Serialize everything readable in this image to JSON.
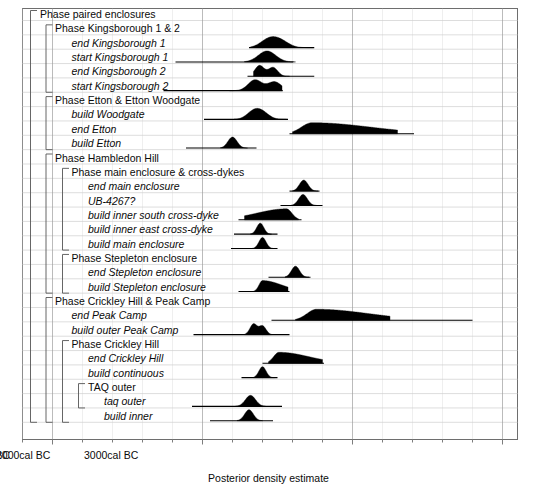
{
  "chart_data": {
    "type": "area",
    "title": "",
    "xlabel": "Posterior density estimate",
    "ylabel": "",
    "xlim": [
      5200,
      1900
    ],
    "x_direction": "cal BC decreasing left to right",
    "grid": true,
    "legend": null,
    "axis": {
      "ticks": [
        {
          "value": 5000,
          "label": "5000cal BC"
        },
        {
          "value": 4000,
          "label": "4000cal BC"
        },
        {
          "value": 3000,
          "label": "3000cal BC"
        },
        {
          "value": 2000,
          "label": "2000cal BC"
        }
      ],
      "minor_tick_interval": 200
    },
    "rows": [
      {
        "label": "Phase paired enclosures",
        "kind": "group",
        "depth": 0,
        "distribution": null,
        "range": null
      },
      {
        "label": "Phase Kingsborough 1 & 2",
        "kind": "group",
        "depth": 1,
        "distribution": null,
        "range": null
      },
      {
        "label": "end Kingsborough 1",
        "kind": "event",
        "depth": 2,
        "distribution": {
          "mode": 3520,
          "peaks": [
            3560,
            3480
          ],
          "start": 3680,
          "end": 3260,
          "shape": "bimodal"
        },
        "range": {
          "from": 3690,
          "to": 3255
        }
      },
      {
        "label": "start Kingsborough 1",
        "kind": "event",
        "depth": 2,
        "distribution": {
          "mode": 3570,
          "peaks": [
            3570
          ],
          "start": 3720,
          "end": 3380,
          "shape": "unimodal"
        },
        "range": {
          "from": 4180,
          "to": 3395
        }
      },
      {
        "label": "end Kingsborough 2",
        "kind": "event",
        "depth": 2,
        "distribution": {
          "mode": 3540,
          "peaks": [
            3620,
            3530
          ],
          "start": 3660,
          "end": 3420,
          "shape": "bimodal"
        },
        "range": {
          "from": 3700,
          "to": 3255
        }
      },
      {
        "label": "start Kingsborough 2",
        "kind": "event",
        "depth": 2,
        "distribution": {
          "mode": 3640,
          "peaks": [
            3650,
            3520
          ],
          "start": 3820,
          "end": 3470,
          "shape": "bimodal"
        },
        "range": {
          "from": 4260,
          "to": 3465
        }
      },
      {
        "label": "Phase Etton & Etton Woodgate",
        "kind": "group",
        "depth": 1,
        "distribution": null,
        "range": null
      },
      {
        "label": "build Woodgate",
        "kind": "event",
        "depth": 2,
        "distribution": {
          "mode": 3620,
          "peaks": [
            3660,
            3600
          ],
          "start": 3790,
          "end": 3440,
          "shape": "bimodal"
        },
        "range": {
          "from": 3990,
          "to": 3430
        }
      },
      {
        "label": "end Etton",
        "kind": "event",
        "depth": 2,
        "distribution": {
          "mode": 3270,
          "peaks": [
            3270
          ],
          "start": 3400,
          "end": 2700,
          "shape": "right-skewed"
        },
        "range": {
          "from": 3420,
          "to": 2590
        }
      },
      {
        "label": "build Etton",
        "kind": "event",
        "depth": 2,
        "distribution": {
          "mode": 3800,
          "peaks": [
            3800
          ],
          "start": 3880,
          "end": 3700,
          "shape": "unimodal"
        },
        "range": {
          "from": 4110,
          "to": 3640
        }
      },
      {
        "label": "Phase Hambledon Hill",
        "kind": "group",
        "depth": 1,
        "distribution": null,
        "range": null
      },
      {
        "label": "Phase main enclosure & cross-dykes",
        "kind": "group",
        "depth": 2,
        "distribution": null,
        "range": null
      },
      {
        "label": "end main enclosure",
        "kind": "event",
        "depth": 3,
        "distribution": {
          "mode": 3325,
          "peaks": [
            3325
          ],
          "start": 3400,
          "end": 3230,
          "shape": "unimodal"
        },
        "range": {
          "from": 3420,
          "to": 3220
        }
      },
      {
        "label": "UB-4267?",
        "kind": "event",
        "depth": 3,
        "distribution": {
          "mode": 3330,
          "peaks": [
            3330
          ],
          "start": 3410,
          "end": 3240,
          "shape": "unimodal"
        },
        "range": {
          "from": 3480,
          "to": 3200
        }
      },
      {
        "label": "build inner south cross-dyke",
        "kind": "event",
        "depth": 3,
        "distribution": {
          "mode": 3440,
          "peaks": [
            3440
          ],
          "start": 3720,
          "end": 3360,
          "shape": "left-skewed"
        },
        "range": {
          "from": 3760,
          "to": 3340
        }
      },
      {
        "label": "build inner east cross-dyke",
        "kind": "event",
        "depth": 3,
        "distribution": {
          "mode": 3615,
          "peaks": [
            3615
          ],
          "start": 3680,
          "end": 3540,
          "shape": "unimodal"
        },
        "range": {
          "from": 3790,
          "to": 3500
        }
      },
      {
        "label": "build main enclosure",
        "kind": "event",
        "depth": 3,
        "distribution": {
          "mode": 3600,
          "peaks": [
            3600
          ],
          "start": 3670,
          "end": 3530,
          "shape": "unimodal"
        },
        "range": {
          "from": 3810,
          "to": 3500
        }
      },
      {
        "label": "Phase Stepleton enclosure",
        "kind": "group",
        "depth": 2,
        "distribution": null,
        "range": null
      },
      {
        "label": "end Stepleton enclosure",
        "kind": "event",
        "depth": 3,
        "distribution": {
          "mode": 3380,
          "peaks": [
            3380
          ],
          "start": 3450,
          "end": 3290,
          "shape": "unimodal"
        },
        "range": {
          "from": 3560,
          "to": 3280
        }
      },
      {
        "label": "build Stepleton enclosure",
        "kind": "event",
        "depth": 3,
        "distribution": {
          "mode": 3600,
          "peaks": [
            3600
          ],
          "start": 3660,
          "end": 3430,
          "shape": "right-skewed"
        },
        "range": {
          "from": 3760,
          "to": 3420
        }
      },
      {
        "label": "Phase Crickley Hill & Peak Camp",
        "kind": "group",
        "depth": 1,
        "distribution": null,
        "range": null
      },
      {
        "label": "end Peak Camp",
        "kind": "event",
        "depth": 2,
        "distribution": {
          "mode": 3240,
          "peaks": [
            3240
          ],
          "start": 3380,
          "end": 2750,
          "shape": "right-skewed"
        },
        "range": {
          "from": 3540,
          "to": 2200
        }
      },
      {
        "label": "build outer Peak Camp",
        "kind": "event",
        "depth": 2,
        "distribution": {
          "mode": 3640,
          "peaks": [
            3660,
            3600
          ],
          "start": 3720,
          "end": 3540,
          "shape": "bimodal"
        },
        "range": {
          "from": 4060,
          "to": 3420
        }
      },
      {
        "label": "Phase Crickley Hill",
        "kind": "group",
        "depth": 2,
        "distribution": null,
        "range": null
      },
      {
        "label": "end Crickley Hill",
        "kind": "event",
        "depth": 3,
        "distribution": {
          "mode": 3490,
          "peaks": [
            3490
          ],
          "start": 3560,
          "end": 3200,
          "shape": "right-skewed"
        },
        "range": {
          "from": 3600,
          "to": 3190
        }
      },
      {
        "label": "build continuous",
        "kind": "event",
        "depth": 3,
        "distribution": {
          "mode": 3600,
          "peaks": [
            3600
          ],
          "start": 3660,
          "end": 3520,
          "shape": "unimodal"
        },
        "range": {
          "from": 3740,
          "to": 3500
        }
      },
      {
        "label": "TAQ outer",
        "kind": "group",
        "depth": 3,
        "distribution": null,
        "range": null
      },
      {
        "label": "taq outer",
        "kind": "event",
        "depth": 4,
        "distribution": {
          "mode": 3680,
          "peaks": [
            3680
          ],
          "start": 3780,
          "end": 3580,
          "shape": "unimodal"
        },
        "range": {
          "from": 4070,
          "to": 3470
        }
      },
      {
        "label": "build inner",
        "kind": "event",
        "depth": 4,
        "distribution": {
          "mode": 3690,
          "peaks": [
            3690
          ],
          "start": 3770,
          "end": 3600,
          "shape": "unimodal"
        },
        "range": {
          "from": 3950,
          "to": 3530
        }
      }
    ],
    "brackets": [
      {
        "depth": 0,
        "from_row": 0,
        "to_row": 28
      },
      {
        "depth": 1,
        "from_row": 1,
        "to_row": 5
      },
      {
        "depth": 1,
        "from_row": 6,
        "to_row": 9
      },
      {
        "depth": 1,
        "from_row": 10,
        "to_row": 19
      },
      {
        "depth": 2,
        "from_row": 11,
        "to_row": 16
      },
      {
        "depth": 2,
        "from_row": 17,
        "to_row": 19
      },
      {
        "depth": 1,
        "from_row": 20,
        "to_row": 28
      },
      {
        "depth": 2,
        "from_row": 23,
        "to_row": 28
      },
      {
        "depth": 3,
        "from_row": 26,
        "to_row": 27
      }
    ]
  },
  "colors": {
    "frame": "#6e6e6e",
    "gridline": "#cfcfcf",
    "major_gridline": "#9a9a9a",
    "curve_fill": "#000000",
    "range_bar": "#000000",
    "bracket": "#555555",
    "text": "#0a0a0a",
    "background": "#ffffff"
  }
}
